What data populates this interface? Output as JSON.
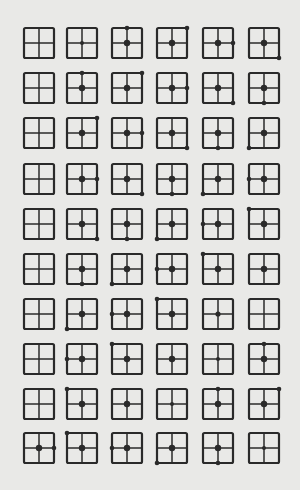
{
  "figure": {
    "rows": 10,
    "cols": 6,
    "colors": {
      "background": "#e9e9e7",
      "ink": "#2a2a2a"
    },
    "col_x": [
      39,
      82,
      127,
      172,
      218,
      264
    ],
    "row_y": [
      43,
      88,
      133,
      179,
      224,
      269,
      314,
      359,
      404,
      448
    ],
    "square_size": 30,
    "cells": [
      [
        {
          "c": "none",
          "p": "none"
        },
        {
          "c": "small",
          "p": "none"
        },
        {
          "c": "big",
          "p": "T"
        },
        {
          "c": "big",
          "p": "TR"
        },
        {
          "c": "big",
          "p": "R"
        },
        {
          "c": "big",
          "p": "BR"
        }
      ],
      [
        {
          "c": "none",
          "p": "none"
        },
        {
          "c": "big",
          "p": "T"
        },
        {
          "c": "big",
          "p": "TR"
        },
        {
          "c": "big",
          "p": "R"
        },
        {
          "c": "big",
          "p": "BR"
        },
        {
          "c": "big",
          "p": "B"
        }
      ],
      [
        {
          "c": "none",
          "p": "none"
        },
        {
          "c": "big",
          "p": "TR"
        },
        {
          "c": "big",
          "p": "R"
        },
        {
          "c": "big",
          "p": "BR"
        },
        {
          "c": "big",
          "p": "B"
        },
        {
          "c": "big",
          "p": "BL"
        }
      ],
      [
        {
          "c": "none",
          "p": "none"
        },
        {
          "c": "big",
          "p": "R"
        },
        {
          "c": "big",
          "p": "BR"
        },
        {
          "c": "big",
          "p": "B"
        },
        {
          "c": "big",
          "p": "BL"
        },
        {
          "c": "big",
          "p": "L"
        }
      ],
      [
        {
          "c": "none",
          "p": "none"
        },
        {
          "c": "big",
          "p": "BR"
        },
        {
          "c": "big",
          "p": "B"
        },
        {
          "c": "big",
          "p": "BL"
        },
        {
          "c": "big",
          "p": "L"
        },
        {
          "c": "big",
          "p": "TL"
        }
      ],
      [
        {
          "c": "none",
          "p": "none"
        },
        {
          "c": "big",
          "p": "B"
        },
        {
          "c": "big",
          "p": "BL"
        },
        {
          "c": "big",
          "p": "L"
        },
        {
          "c": "big",
          "p": "TL"
        },
        {
          "c": "big",
          "p": "none"
        }
      ],
      [
        {
          "c": "none",
          "p": "none"
        },
        {
          "c": "big",
          "p": "BL"
        },
        {
          "c": "big",
          "p": "L"
        },
        {
          "c": "big",
          "p": "TL"
        },
        {
          "c": "mid",
          "p": "none"
        },
        {
          "c": "none",
          "p": "none"
        }
      ],
      [
        {
          "c": "none",
          "p": "none"
        },
        {
          "c": "big",
          "p": "L"
        },
        {
          "c": "big",
          "p": "TL"
        },
        {
          "c": "big",
          "p": "none"
        },
        {
          "c": "small",
          "p": "none"
        },
        {
          "c": "big",
          "p": "T"
        }
      ],
      [
        {
          "c": "none",
          "p": "none"
        },
        {
          "c": "big",
          "p": "TL"
        },
        {
          "c": "big",
          "p": "none"
        },
        {
          "c": "small",
          "p": "none"
        },
        {
          "c": "big",
          "p": "T"
        },
        {
          "c": "big",
          "p": "TR"
        }
      ],
      [
        {
          "c": "big",
          "p": "R"
        },
        {
          "c": "big",
          "p": "TL"
        },
        {
          "c": "big",
          "p": "L"
        },
        {
          "c": "big",
          "p": "BL"
        },
        {
          "c": "big",
          "p": "B"
        },
        {
          "c": "small",
          "p": "none"
        }
      ]
    ]
  }
}
